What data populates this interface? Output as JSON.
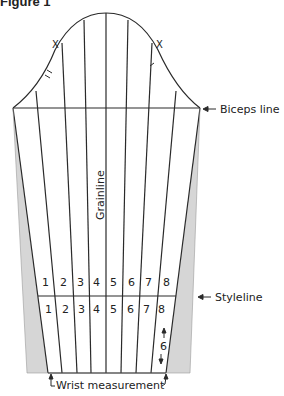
{
  "figure": {
    "title": "Figure 1"
  },
  "diagram": {
    "labels": {
      "biceps_line": "Biceps line",
      "styleline": "Styleline",
      "grainline": "Grainline",
      "wrist_measurement": "Wrist measurement",
      "notch_left": "X",
      "notch_right": "X",
      "difference": "6"
    },
    "panels_upper": [
      "1",
      "2",
      "3",
      "4",
      "5",
      "6",
      "7",
      "8"
    ],
    "panels_lower": [
      "1",
      "2",
      "3",
      "4",
      "5",
      "6",
      "7",
      "8"
    ],
    "colors": {
      "line": "#2a2a2a",
      "shading": "#d6d6d6"
    }
  }
}
